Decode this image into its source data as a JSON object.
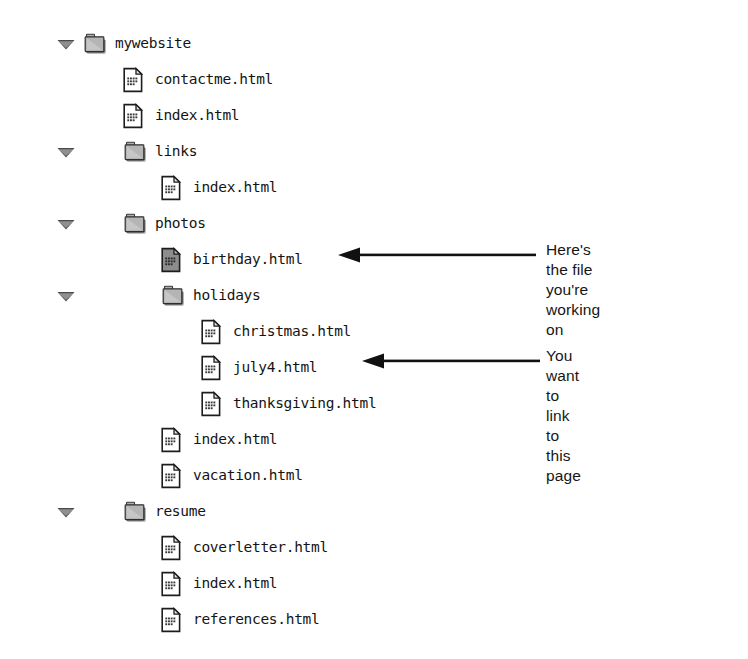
{
  "view": {
    "kind": "file-tree",
    "background_color": "#ffffff",
    "text_color": "#141414",
    "folder_color": "#9a9a9a",
    "selected_file_color": "#8c8c8c"
  },
  "tree": {
    "root_label": "mywebsite",
    "items": [
      {
        "label": "mywebsite",
        "type": "folder",
        "level": 0,
        "expanded": true,
        "selected": false,
        "twisty": "disclosure-triangle-down"
      },
      {
        "label": "contactme.html",
        "type": "file",
        "level": 1,
        "expanded": false,
        "selected": false,
        "twisty": ""
      },
      {
        "label": "index.html",
        "type": "file",
        "level": 1,
        "expanded": false,
        "selected": false,
        "twisty": ""
      },
      {
        "label": "links",
        "type": "folder",
        "level": 1,
        "expanded": true,
        "selected": false,
        "twisty": "disclosure-triangle-down"
      },
      {
        "label": "index.html",
        "type": "file",
        "level": 2,
        "expanded": false,
        "selected": false,
        "twisty": ""
      },
      {
        "label": "photos",
        "type": "folder",
        "level": 1,
        "expanded": true,
        "selected": false,
        "twisty": "disclosure-triangle-down"
      },
      {
        "label": "birthday.html",
        "type": "file",
        "level": 2,
        "expanded": false,
        "selected": true,
        "twisty": ""
      },
      {
        "label": "holidays",
        "type": "folder",
        "level": 2,
        "expanded": true,
        "selected": false,
        "twisty": "disclosure-triangle-down"
      },
      {
        "label": "christmas.html",
        "type": "file",
        "level": 3,
        "expanded": false,
        "selected": false,
        "twisty": ""
      },
      {
        "label": "july4.html",
        "type": "file",
        "level": 3,
        "expanded": false,
        "selected": false,
        "twisty": ""
      },
      {
        "label": "thanksgiving.html",
        "type": "file",
        "level": 3,
        "expanded": false,
        "selected": false,
        "twisty": ""
      },
      {
        "label": "index.html",
        "type": "file",
        "level": 2,
        "expanded": false,
        "selected": false,
        "twisty": ""
      },
      {
        "label": "vacation.html",
        "type": "file",
        "level": 2,
        "expanded": false,
        "selected": false,
        "twisty": ""
      },
      {
        "label": "resume",
        "type": "folder",
        "level": 1,
        "expanded": true,
        "selected": false,
        "twisty": "disclosure-triangle-down"
      },
      {
        "label": "coverletter.html",
        "type": "file",
        "level": 2,
        "expanded": false,
        "selected": false,
        "twisty": ""
      },
      {
        "label": "index.html",
        "type": "file",
        "level": 2,
        "expanded": false,
        "selected": false,
        "twisty": ""
      },
      {
        "label": "references.html",
        "type": "file",
        "level": 2,
        "expanded": false,
        "selected": false,
        "twisty": ""
      }
    ]
  },
  "annotations": [
    {
      "id": "current-file",
      "text": "Here's the file you're\nworking on",
      "points_to": "birthday.html",
      "arrow": "arrow-left-icon"
    },
    {
      "id": "link-target",
      "text": "You want to link\nto this page",
      "points_to": "july4.html",
      "arrow": "arrow-left-icon"
    }
  ]
}
